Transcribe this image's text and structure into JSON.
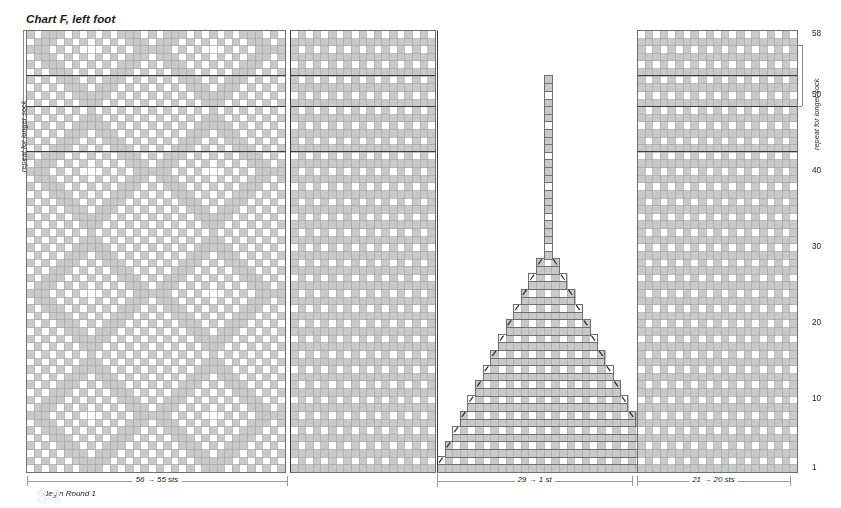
{
  "title": "Chart F, left foot",
  "labels": {
    "repeat_left": "repeat for longer sock",
    "repeat_right": "repeat for longer sock",
    "begin_round": "Begin Round 1",
    "span_left": "56 → 55 sts",
    "span_center": "29 → 1 st",
    "span_right": "21 → 20 sts",
    "watermark": "84"
  },
  "colors": {
    "shaded": "#c9c9c9",
    "background": "#ffffff",
    "grid": "#9f9f9f",
    "grid_bold": "#3c3c3c",
    "outline": "#6f6f6f",
    "symbol": "#222222",
    "bracket": "#8a8a8a",
    "text": "#1a1a1a"
  },
  "grid": {
    "cell_w": 7.62,
    "cell_h": 7.62,
    "rows": 58,
    "row_numbers": [
      1,
      10,
      20,
      30,
      40,
      50,
      58
    ],
    "row_number_x": 812,
    "base_y": 471.5,
    "bold_row_lines": [
      42,
      48,
      52
    ],
    "note": "row 1 at bottom, row 58 at top"
  },
  "chart_data": {
    "type": "heatmap",
    "title": "Chart F, left foot",
    "xlabel": "stitches",
    "ylabel": "rounds",
    "legend": [
      "background (white)",
      "contrast (grey)",
      "decrease /",
      "decrease \\\\"
    ],
    "panels": [
      {
        "name": "left-instep-panel",
        "x": 26,
        "width_sts": 34,
        "top_row": 58,
        "bottom_row": 1,
        "motif": "argyle-diamond",
        "label": "56 → 55 sts"
      },
      {
        "name": "second-panel",
        "x": 290,
        "width_sts": 19,
        "top_row": 58,
        "bottom_row": 1,
        "motif": "small-check",
        "label": ""
      },
      {
        "name": "center-gusset-triangle",
        "x": 437,
        "width_sts": 29,
        "top_row": 58,
        "bottom_row": 1,
        "motif": "triangular-decrease",
        "label": "29 → 1 st",
        "decreases": {
          "left_symbol": "/",
          "right_symbol": "\\\\",
          "start_sts": 29,
          "end_sts": 1
        }
      },
      {
        "name": "right-sole-panel",
        "x": 637,
        "width_sts": 21,
        "top_row": 58,
        "bottom_row": 1,
        "motif": "small-check",
        "label": "21 → 20 sts"
      }
    ],
    "axis_ticks_y": [
      1,
      10,
      20,
      30,
      40,
      50,
      58
    ],
    "grid": true,
    "legend_position": "none"
  },
  "spans": [
    {
      "name": "span-left",
      "label": "56 → 55 sts",
      "x1": 27,
      "x2": 287,
      "y": 481
    },
    {
      "name": "span-center",
      "label": "29 → 1 st",
      "x1": 437,
      "x2": 632,
      "y": 481
    },
    {
      "name": "span-right",
      "label": "21 → 20 sts",
      "x1": 637,
      "x2": 790,
      "y": 481
    }
  ]
}
